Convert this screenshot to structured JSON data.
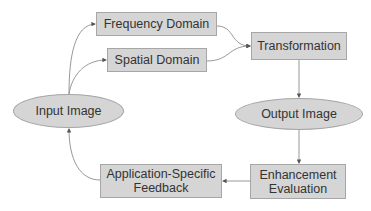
{
  "diagram": {
    "type": "flowchart",
    "colors": {
      "node_fill": "#d5d5d5",
      "node_border": "#a6a6a6",
      "text": "#333333",
      "edge": "#8c8c8c"
    },
    "nodes": [
      {
        "id": "input",
        "label": "Input Image",
        "shape": "ellipse"
      },
      {
        "id": "freq",
        "label": "Frequency Domain",
        "shape": "rect"
      },
      {
        "id": "spatial",
        "label": "Spatial Domain",
        "shape": "rect"
      },
      {
        "id": "transform",
        "label": "Transformation",
        "shape": "rect"
      },
      {
        "id": "output",
        "label": "Output Image",
        "shape": "ellipse"
      },
      {
        "id": "eval",
        "label": "Enhancement Evaluation",
        "shape": "rect"
      },
      {
        "id": "feedback",
        "label": "Application-Specific Feedback",
        "shape": "rect"
      }
    ],
    "edges": [
      {
        "from": "input",
        "to": "freq"
      },
      {
        "from": "input",
        "to": "spatial"
      },
      {
        "from": "freq",
        "to": "transform"
      },
      {
        "from": "spatial",
        "to": "transform"
      },
      {
        "from": "transform",
        "to": "output"
      },
      {
        "from": "output",
        "to": "eval"
      },
      {
        "from": "eval",
        "to": "feedback"
      },
      {
        "from": "feedback",
        "to": "input"
      }
    ],
    "labels": {
      "input": "Input Image",
      "freq": "Frequency Domain",
      "spatial": "Spatial Domain",
      "transform": "Transformation",
      "output": "Output Image",
      "eval_line1": "Enhancement",
      "eval_line2": "Evaluation",
      "feedback_line1": "Application-Specific",
      "feedback_line2": "Feedback"
    }
  }
}
